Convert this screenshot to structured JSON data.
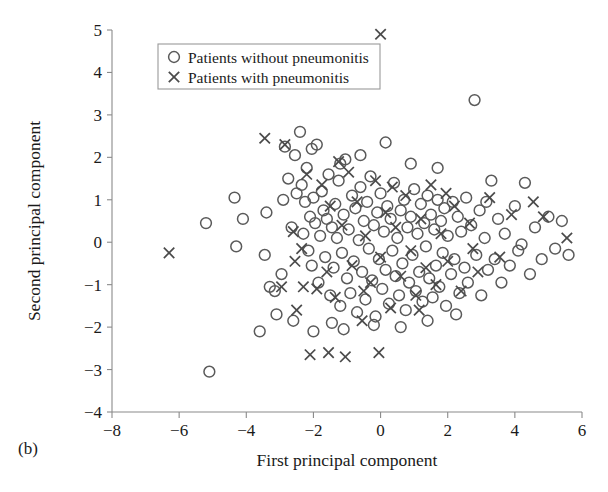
{
  "panel": {
    "label": "(b)"
  },
  "legend": {
    "position": "upper-left-inside",
    "entries": [
      {
        "marker": "circle-marker-icon",
        "label": "Patients without pneumonitis"
      },
      {
        "marker": "cross-marker-icon",
        "label": "Patients with pneumonitis"
      }
    ]
  },
  "colors": {
    "circle_stroke": "#5a5a5a",
    "cross_stroke": "#4a4a4a",
    "axis": "#8a8a8a",
    "text": "#1a1a1a",
    "background": "#ffffff"
  },
  "chart_data": {
    "type": "scatter",
    "title": "",
    "xlabel": "First principal component",
    "ylabel": "Second principal component",
    "xlim": [
      -8,
      6
    ],
    "ylim": [
      -4,
      5
    ],
    "xticks": [
      -8,
      -6,
      -4,
      -2,
      0,
      2,
      4,
      6
    ],
    "yticks": [
      -4,
      -3,
      -2,
      -1,
      0,
      1,
      2,
      3,
      4,
      5
    ],
    "grid": false,
    "legend_entries": [
      "Patients without pneumonitis",
      "Patients with pneumonitis"
    ],
    "series": [
      {
        "name": "Patients without pneumonitis",
        "marker": "circle",
        "points": [
          [
            -5.2,
            0.45
          ],
          [
            -5.1,
            -3.05
          ],
          [
            -4.35,
            1.05
          ],
          [
            -4.3,
            -0.1
          ],
          [
            -4.1,
            0.55
          ],
          [
            -3.45,
            -0.3
          ],
          [
            -3.4,
            0.7
          ],
          [
            -3.3,
            -1.05
          ],
          [
            -3.15,
            -1.15
          ],
          [
            -3.1,
            -1.7
          ],
          [
            -2.95,
            -0.75
          ],
          [
            -2.85,
            2.25
          ],
          [
            -2.75,
            1.5
          ],
          [
            -2.6,
            -1.85
          ],
          [
            -2.55,
            2.05
          ],
          [
            -2.5,
            1.15
          ],
          [
            -2.4,
            2.6
          ],
          [
            -2.35,
            1.35
          ],
          [
            -2.3,
            0.2
          ],
          [
            -2.25,
            0.95
          ],
          [
            -2.2,
            1.75
          ],
          [
            -2.15,
            -0.2
          ],
          [
            -2.1,
            0.6
          ],
          [
            -2.05,
            -0.55
          ],
          [
            -2.0,
            1.05
          ],
          [
            -1.95,
            0.45
          ],
          [
            -1.9,
            2.3
          ],
          [
            -1.85,
            -0.95
          ],
          [
            -1.8,
            0.15
          ],
          [
            -1.75,
            1.2
          ],
          [
            -1.7,
            0.75
          ],
          [
            -1.65,
            -0.35
          ],
          [
            -1.6,
            0.55
          ],
          [
            -1.55,
            1.6
          ],
          [
            -1.5,
            -1.25
          ],
          [
            -1.45,
            0.35
          ],
          [
            -1.4,
            -0.6
          ],
          [
            -1.35,
            0.9
          ],
          [
            -1.3,
            0.1
          ],
          [
            -1.25,
            1.45
          ],
          [
            -1.2,
            -1.5
          ],
          [
            -1.15,
            -0.25
          ],
          [
            -1.1,
            0.65
          ],
          [
            -1.05,
            1.95
          ],
          [
            -1.0,
            -0.85
          ],
          [
            -0.95,
            0.3
          ],
          [
            -0.9,
            -1.2
          ],
          [
            -0.85,
            1.1
          ],
          [
            -0.8,
            -0.45
          ],
          [
            -0.75,
            0.8
          ],
          [
            -0.7,
            -1.65
          ],
          [
            -0.65,
            0.05
          ],
          [
            -0.6,
            1.3
          ],
          [
            -0.55,
            -0.7
          ],
          [
            -0.5,
            0.5
          ],
          [
            -0.45,
            -1.35
          ],
          [
            -0.4,
            0.95
          ],
          [
            -0.35,
            -0.15
          ],
          [
            -0.3,
            1.55
          ],
          [
            -0.25,
            -0.9
          ],
          [
            -0.2,
            0.4
          ],
          [
            -0.15,
            -1.75
          ],
          [
            -0.1,
            0.7
          ],
          [
            -0.05,
            -0.4
          ],
          [
            0.0,
            1.15
          ],
          [
            0.05,
            -1.1
          ],
          [
            0.1,
            0.25
          ],
          [
            0.15,
            -0.65
          ],
          [
            0.2,
            0.85
          ],
          [
            0.25,
            -1.45
          ],
          [
            0.3,
            0.55
          ],
          [
            0.35,
            -0.2
          ],
          [
            0.4,
            1.4
          ],
          [
            0.45,
            -0.8
          ],
          [
            0.5,
            0.1
          ],
          [
            0.55,
            -1.25
          ],
          [
            0.6,
            0.75
          ],
          [
            0.65,
            -0.5
          ],
          [
            0.7,
            1.0
          ],
          [
            0.75,
            -1.6
          ],
          [
            0.8,
            0.35
          ],
          [
            0.85,
            -0.95
          ],
          [
            0.9,
            0.6
          ],
          [
            0.95,
            -0.3
          ],
          [
            1.0,
            1.25
          ],
          [
            1.05,
            -1.15
          ],
          [
            1.1,
            0.2
          ],
          [
            1.15,
            -0.7
          ],
          [
            1.2,
            0.9
          ],
          [
            1.25,
            -1.4
          ],
          [
            1.3,
            0.45
          ],
          [
            1.35,
            -0.1
          ],
          [
            1.4,
            1.1
          ],
          [
            1.45,
            -0.85
          ],
          [
            1.5,
            0.65
          ],
          [
            1.55,
            -1.3
          ],
          [
            1.6,
            0.3
          ],
          [
            1.65,
            -0.55
          ],
          [
            1.7,
            1.0
          ],
          [
            1.75,
            -1.05
          ],
          [
            1.8,
            0.5
          ],
          [
            1.85,
            -0.25
          ],
          [
            1.9,
            0.8
          ],
          [
            1.95,
            -1.5
          ],
          [
            2.0,
            0.15
          ],
          [
            2.1,
            -0.75
          ],
          [
            2.15,
            0.95
          ],
          [
            2.2,
            -0.4
          ],
          [
            2.3,
            0.6
          ],
          [
            2.35,
            -1.2
          ],
          [
            2.4,
            0.25
          ],
          [
            2.5,
            -0.6
          ],
          [
            2.55,
            1.05
          ],
          [
            2.6,
            -0.95
          ],
          [
            2.7,
            0.4
          ],
          [
            2.8,
            3.35
          ],
          [
            2.85,
            -0.3
          ],
          [
            2.95,
            0.75
          ],
          [
            3.0,
            -1.25
          ],
          [
            3.1,
            0.1
          ],
          [
            3.2,
            -0.65
          ],
          [
            3.3,
            1.45
          ],
          [
            3.4,
            -0.4
          ],
          [
            3.5,
            0.55
          ],
          [
            3.6,
            -0.95
          ],
          [
            3.7,
            0.2
          ],
          [
            3.85,
            -0.55
          ],
          [
            4.0,
            0.85
          ],
          [
            4.1,
            -0.2
          ],
          [
            4.3,
            1.4
          ],
          [
            4.45,
            -0.75
          ],
          [
            4.6,
            0.35
          ],
          [
            4.8,
            -0.4
          ],
          [
            5.0,
            0.6
          ],
          [
            5.2,
            -0.15
          ],
          [
            5.4,
            0.5
          ],
          [
            5.6,
            -0.3
          ],
          [
            -2.0,
            -2.1
          ],
          [
            -1.1,
            -2.05
          ],
          [
            -0.2,
            -1.95
          ],
          [
            0.6,
            -2.0
          ],
          [
            1.4,
            -1.85
          ],
          [
            -1.45,
            -1.9
          ],
          [
            2.25,
            -1.7
          ],
          [
            -3.6,
            -2.1
          ],
          [
            -0.6,
            2.05
          ],
          [
            0.15,
            2.35
          ],
          [
            -2.05,
            2.2
          ],
          [
            -1.2,
            1.85
          ],
          [
            3.15,
            0.95
          ],
          [
            -2.65,
            0.35
          ],
          [
            -2.9,
            1.0
          ],
          [
            4.2,
            -0.05
          ],
          [
            0.9,
            1.85
          ],
          [
            1.7,
            1.75
          ]
        ]
      },
      {
        "name": "Patients with pneumonitis",
        "marker": "cross",
        "points": [
          [
            0.0,
            4.9
          ],
          [
            -6.3,
            -0.25
          ],
          [
            -3.45,
            2.45
          ],
          [
            -2.85,
            2.3
          ],
          [
            -2.6,
            0.25
          ],
          [
            -2.55,
            -0.45
          ],
          [
            -2.5,
            -1.6
          ],
          [
            -2.35,
            -0.15
          ],
          [
            -2.3,
            -1.05
          ],
          [
            -2.1,
            -2.65
          ],
          [
            -1.75,
            1.35
          ],
          [
            -1.6,
            -0.7
          ],
          [
            -1.5,
            0.85
          ],
          [
            -1.35,
            -1.3
          ],
          [
            -1.15,
            0.4
          ],
          [
            -1.05,
            -2.7
          ],
          [
            -0.95,
            1.65
          ],
          [
            -0.85,
            -0.55
          ],
          [
            -0.7,
            0.95
          ],
          [
            -0.55,
            -1.85
          ],
          [
            -0.45,
            0.15
          ],
          [
            -0.3,
            -0.95
          ],
          [
            -0.15,
            1.45
          ],
          [
            0.0,
            -0.35
          ],
          [
            0.15,
            0.7
          ],
          [
            0.3,
            -1.55
          ],
          [
            0.45,
            0.35
          ],
          [
            0.6,
            -0.8
          ],
          [
            0.75,
            1.1
          ],
          [
            0.9,
            -0.2
          ],
          [
            1.05,
            -1.25
          ],
          [
            1.2,
            0.55
          ],
          [
            1.35,
            -0.6
          ],
          [
            1.5,
            1.35
          ],
          [
            1.65,
            -1.0
          ],
          [
            1.8,
            0.2
          ],
          [
            2.0,
            -0.45
          ],
          [
            2.2,
            0.85
          ],
          [
            2.4,
            -1.15
          ],
          [
            2.65,
            0.45
          ],
          [
            2.9,
            -0.7
          ],
          [
            3.25,
            1.05
          ],
          [
            3.55,
            -0.35
          ],
          [
            3.9,
            0.65
          ],
          [
            4.55,
            0.95
          ],
          [
            -2.95,
            -1.05
          ],
          [
            -1.9,
            -1.1
          ],
          [
            -1.25,
            1.9
          ],
          [
            0.35,
            1.3
          ],
          [
            1.95,
            1.15
          ],
          [
            -0.5,
            -1.15
          ],
          [
            2.75,
            -0.15
          ],
          [
            -2.2,
            1.6
          ],
          [
            1.15,
            -1.6
          ],
          [
            -0.05,
            -2.6
          ],
          [
            -1.55,
            -2.6
          ],
          [
            5.55,
            0.1
          ],
          [
            4.85,
            0.6
          ]
        ]
      }
    ]
  }
}
